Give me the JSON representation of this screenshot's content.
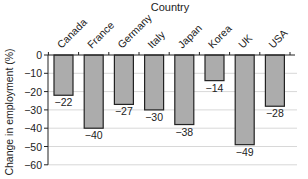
{
  "chart_data": {
    "type": "bar",
    "title": "Country",
    "xlabel": "Country",
    "ylabel": "Change in employment (%)",
    "categories": [
      "Canada",
      "France",
      "Germany",
      "Italy",
      "Japan",
      "Korea",
      "UK",
      "USA"
    ],
    "values": [
      -22,
      -40,
      -27,
      -30,
      -38,
      -14,
      -49,
      -28
    ],
    "value_labels": [
      "−22",
      "−40",
      "−27",
      "−30",
      "−38",
      "−14",
      "−49",
      "−28"
    ],
    "yticks": [
      0,
      -10,
      -20,
      -30,
      -40,
      -50,
      -60
    ],
    "ytick_labels": [
      "0",
      "−10",
      "−20",
      "−30",
      "−40",
      "−50",
      "−60"
    ],
    "ylim": [
      -60,
      0
    ],
    "grid": true,
    "legend": null,
    "x_axis_position": "top",
    "category_label_rotation": -45,
    "colors": {
      "bar_fill": "#acacac",
      "bar_edge": "#222222",
      "grid": "#d8d8d8"
    }
  }
}
